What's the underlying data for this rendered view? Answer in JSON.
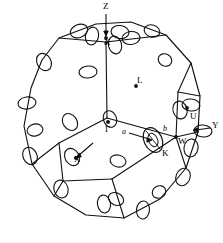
{
  "figure": {
    "type": "brillouin-zone-polyhedron",
    "style": "hand-drawn line sketch",
    "background_color": "#ffffff",
    "line_color": "#111111"
  },
  "labels": [
    {
      "id": "Z",
      "text": "Z",
      "x": 104,
      "y": 6,
      "italic": false,
      "has_arrow": true,
      "arrow": "down"
    },
    {
      "id": "X_top",
      "text": "X",
      "x": 106,
      "y": 38,
      "italic": false,
      "has_arrow": false,
      "arrow": ""
    },
    {
      "id": "L",
      "text": "L",
      "x": 138,
      "y": 81,
      "italic": false,
      "has_arrow": false,
      "arrow": ""
    },
    {
      "id": "U",
      "text": "U",
      "x": 191,
      "y": 114,
      "italic": false,
      "has_arrow": false,
      "arrow": ""
    },
    {
      "id": "Y",
      "text": "Y",
      "x": 212,
      "y": 126,
      "italic": false,
      "has_arrow": true,
      "arrow": "left"
    },
    {
      "id": "W",
      "text": "W",
      "x": 180,
      "y": 140,
      "italic": false,
      "has_arrow": false,
      "arrow": ""
    },
    {
      "id": "K",
      "text": "K",
      "x": 163,
      "y": 150,
      "italic": false,
      "has_arrow": false,
      "arrow": ""
    },
    {
      "id": "a",
      "text": "a",
      "x": 141,
      "y": 131,
      "italic": true,
      "has_arrow": true,
      "arrow": "right"
    },
    {
      "id": "b",
      "text": "b",
      "x": 164,
      "y": 128,
      "italic": true,
      "has_arrow": false,
      "arrow": ""
    },
    {
      "id": "Gamma",
      "text": "Γ",
      "x": 107,
      "y": 130,
      "italic": false,
      "has_arrow": false,
      "arrow": ""
    },
    {
      "id": "X_left",
      "text": "X",
      "x": 80,
      "y": 155,
      "italic": false,
      "has_arrow": true,
      "arrow": "upright"
    }
  ],
  "vertices": [
    {
      "id": "v1",
      "x": 59,
      "y": 38
    },
    {
      "id": "v2",
      "x": 96,
      "y": 24
    },
    {
      "id": "v3",
      "x": 131,
      "y": 22
    },
    {
      "id": "v4",
      "x": 166,
      "y": 35
    },
    {
      "id": "v5",
      "x": 191,
      "y": 63
    },
    {
      "id": "v6",
      "x": 200,
      "y": 96
    },
    {
      "id": "v7",
      "x": 198,
      "y": 132
    },
    {
      "id": "v8",
      "x": 186,
      "y": 168
    },
    {
      "id": "v9",
      "x": 160,
      "y": 199
    },
    {
      "id": "v10",
      "x": 124,
      "y": 218
    },
    {
      "id": "v11",
      "x": 86,
      "y": 215
    },
    {
      "id": "v12",
      "x": 54,
      "y": 196
    },
    {
      "id": "v13",
      "x": 32,
      "y": 164
    },
    {
      "id": "v14",
      "x": 24,
      "y": 126
    },
    {
      "id": "v15",
      "x": 31,
      "y": 88
    },
    {
      "id": "v16",
      "x": 42,
      "y": 60
    }
  ],
  "interior_nodes": [
    {
      "id": "c_top",
      "x": 106,
      "y": 42
    },
    {
      "id": "c_mid",
      "x": 108,
      "y": 118
    },
    {
      "id": "c_left",
      "x": 59,
      "y": 143
    },
    {
      "id": "c_right",
      "x": 176,
      "y": 137
    },
    {
      "id": "c_bot",
      "x": 112,
      "y": 178
    },
    {
      "id": "c_rtop",
      "x": 178,
      "y": 92
    }
  ],
  "edge_glyphs_count": 26,
  "detail_ellipse": {
    "id": "K-pocket",
    "cx": 153,
    "cy": 140,
    "rx": 9,
    "ry": 13,
    "rotation": -25
  }
}
